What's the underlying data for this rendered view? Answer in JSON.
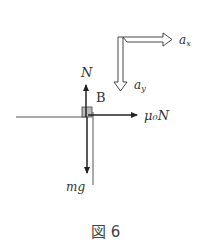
{
  "figure": {
    "caption": "図 6",
    "body_label": "B",
    "forces": {
      "normal": "N",
      "friction": "μ₀N",
      "gravity": "mg"
    },
    "accelerations": {
      "x": "a",
      "x_sub": "x",
      "y": "a",
      "y_sub": "y"
    },
    "colors": {
      "line": "#222222",
      "block_fill": "#9a9a9a",
      "text": "#333333"
    }
  }
}
